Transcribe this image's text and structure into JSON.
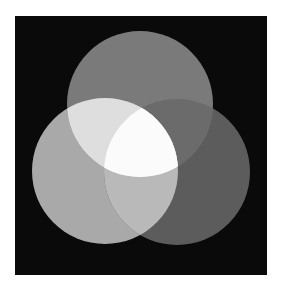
{
  "canvas": {
    "width": 282,
    "height": 289,
    "background": "#ffffff"
  },
  "panel": {
    "x": 15,
    "y": 16,
    "width": 252,
    "height": 259,
    "color": "#0a0a0a"
  },
  "circles": [
    {
      "id": "top",
      "cx": 140,
      "cy": 104,
      "r": 73,
      "color": "#7a7a7a"
    },
    {
      "id": "left",
      "cx": 105,
      "cy": 171,
      "r": 73,
      "color": "#a9a9a9"
    },
    {
      "id": "right",
      "cx": 177,
      "cy": 172,
      "r": 73,
      "color": "#5c5c5c"
    }
  ],
  "overlaps": {
    "top_left": {
      "color": "#dedede"
    },
    "top_right": {
      "color": "#6b6b6b"
    },
    "left_right": {
      "color": "#b9b9b9"
    },
    "top_left_right": {
      "color": "#fbfbfb"
    }
  }
}
